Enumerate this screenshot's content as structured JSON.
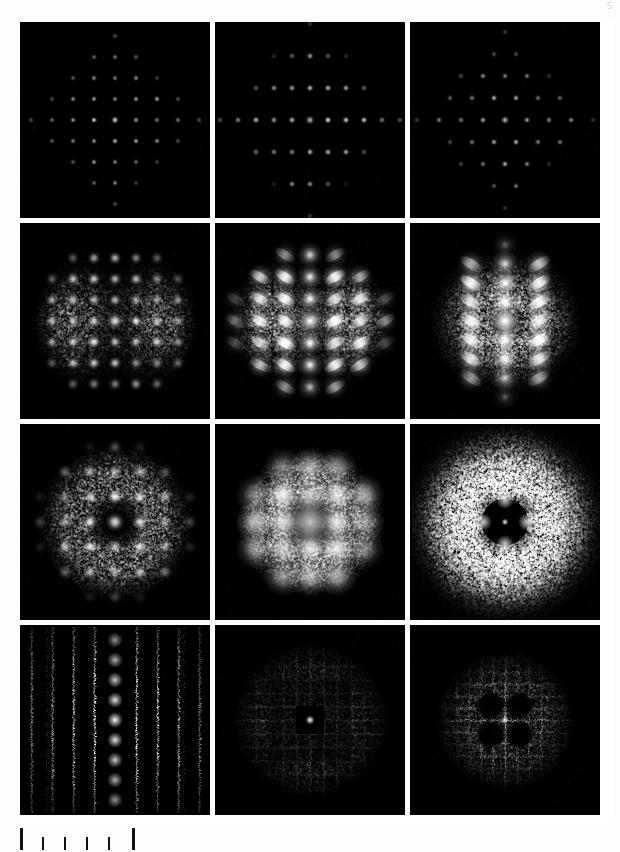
{
  "figure": {
    "page_number": "5",
    "background_color": "#fdfdfd",
    "panel_background_color": "#000000",
    "gutter_color": "#ffffff",
    "rows": 4,
    "columns": 3,
    "panel_width_px": 190,
    "panel_height_px": 196,
    "grid_left_px": 20,
    "grid_top_px": 22
  },
  "scalebar": {
    "name": "scale-bar",
    "tick_count": 6,
    "tick_kinds": [
      "major",
      "minor",
      "minor",
      "minor",
      "minor",
      "major"
    ],
    "tick_positions_px": [
      0,
      22,
      44,
      66,
      88,
      112
    ],
    "tick_color": "#111111",
    "label": ""
  },
  "chart_data": {
    "type": "heatmap",
    "title": "",
    "subtitle": "",
    "xlabel": "",
    "ylabel": "",
    "grid": false,
    "legend_position": "none",
    "row_labels": [
      "row-1",
      "row-2",
      "row-3",
      "row-4"
    ],
    "column_labels": [
      "col-1",
      "col-2",
      "col-3"
    ],
    "panels": [
      {
        "id": "panel-r1c1",
        "row": 1,
        "column": 1,
        "pattern": "square-lattice-sharp-spots",
        "lattice": "square",
        "spot_spacing_x": 21,
        "spot_spacing_y": 21,
        "spot_radius": 1.3,
        "spot_peak_brightness": 0.85,
        "envelope": "diamond",
        "envelope_radius": 78,
        "diffuse_type": "none",
        "diffuse_level": 0.0,
        "background_noise": 0.012,
        "row_offset": 0,
        "streak": "none",
        "center_hole": 0
      },
      {
        "id": "panel-r1c2",
        "row": 1,
        "column": 2,
        "pattern": "rectangular-lattice-sharp-spots",
        "lattice": "rectangular",
        "spot_spacing_x": 18,
        "spot_spacing_y": 32,
        "spot_radius": 1.5,
        "spot_peak_brightness": 0.9,
        "envelope": "diamond",
        "envelope_radius": 82,
        "diffuse_type": "none",
        "diffuse_level": 0.0,
        "background_noise": 0.012,
        "row_offset": 0,
        "streak": "none",
        "center_hole": 0
      },
      {
        "id": "panel-r1c3",
        "row": 1,
        "column": 3,
        "pattern": "centered-rhombic-lattice-sharp-spots",
        "lattice": "centered-rectangular",
        "spot_spacing_x": 22,
        "spot_spacing_y": 22,
        "spot_radius": 1.4,
        "spot_peak_brightness": 0.8,
        "envelope": "diamond",
        "envelope_radius": 76,
        "diffuse_type": "none",
        "diffuse_level": 0.0,
        "background_noise": 0.012,
        "row_offset": 0.5,
        "streak": "none",
        "center_hole": 0
      },
      {
        "id": "panel-r2c1",
        "row": 2,
        "column": 1,
        "pattern": "square-lattice-with-lateral-diffuse-clouds",
        "lattice": "square",
        "spot_spacing_x": 21,
        "spot_spacing_y": 21,
        "spot_radius": 2.6,
        "spot_peak_brightness": 1.0,
        "envelope": "circular",
        "envelope_radius": 84,
        "diffuse_type": "lateral-lobes",
        "diffuse_level": 0.42,
        "background_noise": 0.02,
        "row_offset": 0,
        "streak": "none",
        "center_hole": 0
      },
      {
        "id": "panel-r2c2",
        "row": 2,
        "column": 2,
        "pattern": "streaked-spots-with-bright-central-column",
        "lattice": "square",
        "spot_spacing_x": 25,
        "spot_spacing_y": 22,
        "spot_radius": 5.0,
        "spot_peak_brightness": 1.0,
        "envelope": "circular",
        "envelope_radius": 80,
        "diffuse_type": "lateral-lobes",
        "diffuse_level": 0.6,
        "background_noise": 0.025,
        "row_offset": 0,
        "streak": "oblique",
        "center_hole": 0
      },
      {
        "id": "panel-r2c3",
        "row": 2,
        "column": 3,
        "pattern": "three-bright-columns-with-broad-halo",
        "lattice": "columnar",
        "spot_spacing_x": 34,
        "spot_spacing_y": 19,
        "spot_radius": 5.5,
        "spot_peak_brightness": 1.0,
        "envelope": "circular",
        "envelope_radius": 78,
        "diffuse_type": "broad-halo",
        "diffuse_level": 0.55,
        "background_noise": 0.028,
        "row_offset": 0,
        "streak": "oblique",
        "center_hole": 0
      },
      {
        "id": "panel-r3c1",
        "row": 3,
        "column": 1,
        "pattern": "square-lattice-with-annular-diffuse-ring",
        "lattice": "square",
        "spot_spacing_x": 25,
        "spot_spacing_y": 25,
        "spot_radius": 3.0,
        "spot_peak_brightness": 1.0,
        "envelope": "circular",
        "envelope_radius": 80,
        "diffuse_type": "annulus",
        "diffuse_level": 0.38,
        "background_noise": 0.02,
        "row_offset": 0,
        "streak": "none",
        "center_hole": 26
      },
      {
        "id": "panel-r3c2",
        "row": 3,
        "column": 2,
        "pattern": "broad-blobs-in-ring-dark-core-bright-center-spot",
        "lattice": "square",
        "spot_spacing_x": 27,
        "spot_spacing_y": 27,
        "spot_radius": 8.0,
        "spot_peak_brightness": 1.0,
        "envelope": "circular",
        "envelope_radius": 76,
        "diffuse_type": "annulus",
        "diffuse_level": 0.5,
        "background_noise": 0.022,
        "row_offset": 0,
        "streak": "none",
        "center_hole": 26
      },
      {
        "id": "panel-r3c3",
        "row": 3,
        "column": 3,
        "pattern": "liquid-like-diffuse-halo-with-four-lobes",
        "lattice": "none",
        "spot_spacing_x": 0,
        "spot_spacing_y": 0,
        "spot_radius": 0,
        "spot_peak_brightness": 0.0,
        "envelope": "circular",
        "envelope_radius": 68,
        "diffuse_type": "liquid-halo",
        "diffuse_level": 0.62,
        "background_noise": 0.018,
        "row_offset": 0,
        "streak": "none",
        "center_hole": 22
      },
      {
        "id": "panel-r4c1",
        "row": 4,
        "column": 1,
        "pattern": "vertical-rods-with-central-spot-column",
        "lattice": "columnar-rods",
        "spot_spacing_x": 21,
        "spot_spacing_y": 20,
        "spot_radius": 2.4,
        "spot_peak_brightness": 1.0,
        "envelope": "full-frame",
        "envelope_radius": 95,
        "diffuse_type": "none",
        "diffuse_level": 0.0,
        "background_noise": 0.02,
        "row_offset": 0,
        "streak": "vertical",
        "center_hole": 0
      },
      {
        "id": "panel-r4c2",
        "row": 4,
        "column": 2,
        "pattern": "crosshatch-nested-squares-bright-center",
        "lattice": "crosshatch",
        "spot_spacing_x": 27,
        "spot_spacing_y": 27,
        "spot_radius": 2.0,
        "spot_peak_brightness": 1.0,
        "envelope": "circular",
        "envelope_radius": 78,
        "diffuse_type": "crosshatch",
        "diffuse_level": 0.55,
        "background_noise": 0.02,
        "row_offset": 0,
        "streak": "both",
        "center_hole": 0
      },
      {
        "id": "panel-r4c3",
        "row": 4,
        "column": 3,
        "pattern": "crosshatch-texture-with-four-dark-lobes",
        "lattice": "crosshatch",
        "spot_spacing_x": 24,
        "spot_spacing_y": 24,
        "spot_radius": 1.8,
        "spot_peak_brightness": 0.9,
        "envelope": "circular",
        "envelope_radius": 70,
        "diffuse_type": "crosshatch-lobed",
        "diffuse_level": 0.5,
        "background_noise": 0.018,
        "row_offset": 0,
        "streak": "both",
        "center_hole": 20
      }
    ]
  }
}
